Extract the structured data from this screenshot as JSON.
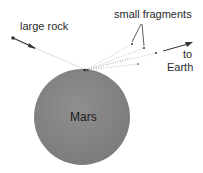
{
  "diagram": {
    "labels": {
      "large_rock": "large rock",
      "small_fragments": "small fragments",
      "to": "to",
      "earth": "Earth",
      "mars": "Mars"
    },
    "colors": {
      "mars_fill": "#8a8a8a",
      "line": "#444444",
      "text": "#2a2a2a"
    }
  }
}
